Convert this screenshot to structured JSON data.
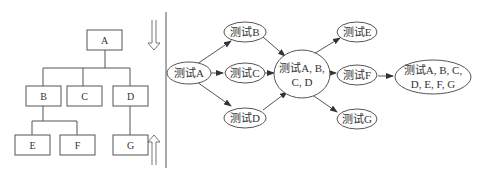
{
  "tree": {
    "nodes": [
      {
        "id": "A",
        "label": "A"
      },
      {
        "id": "B",
        "label": "B"
      },
      {
        "id": "C",
        "label": "C"
      },
      {
        "id": "D",
        "label": "D"
      },
      {
        "id": "E",
        "label": "E"
      },
      {
        "id": "F",
        "label": "F"
      },
      {
        "id": "G",
        "label": "G"
      }
    ],
    "edges": [
      [
        "A",
        "B"
      ],
      [
        "A",
        "C"
      ],
      [
        "A",
        "D"
      ],
      [
        "B",
        "E"
      ],
      [
        "B",
        "F"
      ],
      [
        "D",
        "G"
      ]
    ]
  },
  "arrows": {
    "down": "top-down integration",
    "up": "bottom-up integration"
  },
  "flow": {
    "nodes": {
      "testA": {
        "label": "测试A"
      },
      "testB": {
        "label": "测试B"
      },
      "testC": {
        "label": "测试C"
      },
      "testD": {
        "label": "测试D"
      },
      "testABCD": {
        "line1": "测试A, B,",
        "line2": "C, D"
      },
      "testE": {
        "label": "测试E"
      },
      "testF": {
        "label": "测试F"
      },
      "testG": {
        "label": "测试G"
      },
      "testAll": {
        "line1": "测试A, B, C,",
        "line2": "D, E, F, G"
      }
    },
    "edges": [
      [
        "testA",
        "testB"
      ],
      [
        "testA",
        "testC"
      ],
      [
        "testA",
        "testD"
      ],
      [
        "testB",
        "testABCD"
      ],
      [
        "testC",
        "testABCD"
      ],
      [
        "testD",
        "testABCD"
      ],
      [
        "testABCD",
        "testE"
      ],
      [
        "testABCD",
        "testF"
      ],
      [
        "testABCD",
        "testG"
      ],
      [
        "testF",
        "testAll"
      ]
    ]
  }
}
